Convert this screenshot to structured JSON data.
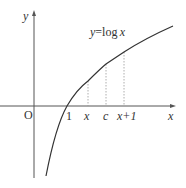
{
  "diagram": {
    "function_label_lhs": "y",
    "function_label_eq": "=",
    "function_label_rhs_fn": "log",
    "function_label_rhs_var": "x",
    "axes": {
      "x_label": "x",
      "y_label": "y",
      "origin_label": "O"
    },
    "ticks": {
      "one": "1",
      "x": "x",
      "c": "c",
      "x_plus_1": "x+1"
    },
    "colors": {
      "curve": "#333333",
      "axis": "#555555",
      "dashed": "#999999",
      "text": "#333333"
    }
  }
}
